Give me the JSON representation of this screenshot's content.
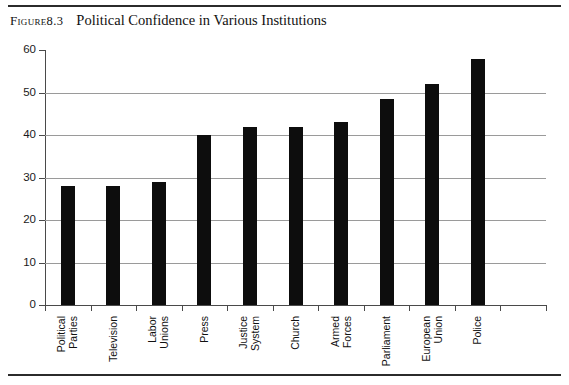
{
  "figure": {
    "label": "Figure",
    "number": "8.3",
    "title": "Political Confidence in Various Institutions"
  },
  "chart_data": {
    "type": "bar",
    "title": "Political Confidence in Various Institutions",
    "xlabel": "",
    "ylabel": "",
    "ylim": [
      0,
      60
    ],
    "yticks": [
      0,
      10,
      20,
      30,
      40,
      50,
      60
    ],
    "grid": true,
    "legend": false,
    "bar_color": "#0d0d0d",
    "categories": [
      "Political Parties",
      "Television",
      "Labor Unions",
      "Press",
      "Justice System",
      "Church",
      "Armed Forces",
      "Parliament",
      "European Union",
      "Police"
    ],
    "category_lines": [
      [
        "Political",
        "Parties"
      ],
      [
        "Television"
      ],
      [
        "Labor",
        "Unions"
      ],
      [
        "Press"
      ],
      [
        "Justice",
        "System"
      ],
      [
        "Church"
      ],
      [
        "Armed",
        "Forces"
      ],
      [
        "Parliament"
      ],
      [
        "European",
        "Union"
      ],
      [
        "Police"
      ]
    ],
    "values": [
      28,
      28,
      29,
      40,
      42,
      42,
      43,
      48.5,
      52,
      58
    ]
  }
}
